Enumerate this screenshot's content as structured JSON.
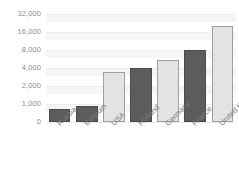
{
  "chart_data": {
    "type": "bar",
    "title": "",
    "subtitle": "",
    "xlabel": "",
    "ylabel": "",
    "categories": [
      "Russia",
      "Belgium",
      "USA",
      "Holland",
      "Germany",
      "France",
      "United Kingdom"
    ],
    "values": [
      700,
      900,
      3400,
      4000,
      5500,
      8000,
      20000
    ],
    "series": [
      {
        "name": "",
        "values": [
          700,
          900,
          3400,
          4000,
          5500,
          8000,
          20000
        ]
      }
    ],
    "bar_styles": [
      "dark",
      "dark",
      "light",
      "dark",
      "light",
      "dark",
      "light"
    ],
    "y_scale": "log2",
    "ytick_labels": [
      "32,000",
      "16,000",
      "8,000",
      "4,000",
      "2,000",
      "1,000",
      "0"
    ],
    "ytick_values": [
      32000,
      16000,
      8000,
      4000,
      2000,
      1000,
      0
    ],
    "ylim": [
      0,
      32000
    ],
    "grid": true,
    "legend": "none",
    "colors": {
      "bar_dark_fill": "#5c5c5c",
      "bar_dark_border": "#4a4a4a",
      "bar_light_fill": "#e3e3e3",
      "bar_light_border": "#9e9e9e",
      "gridline": "#ececec",
      "grid_band": "#f6f6f6",
      "tick_text": "#8d8d8d",
      "category_text": "#7d7d7d",
      "background": "#ffffff"
    }
  }
}
